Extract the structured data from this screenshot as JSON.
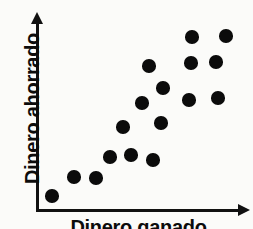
{
  "figure": {
    "title": "",
    "axis_color": "#111111",
    "point_color": "#0b0b0b",
    "background": "#fbfbf9"
  },
  "axes": {
    "y_label": "Dinero ahorrado",
    "x_label": "Dinero ganado",
    "y_arrow_icon": "arrow-up-icon",
    "x_arrow_icon": "arrow-right-icon"
  },
  "chart_data": {
    "type": "scatter",
    "title": "",
    "xlabel": "Dinero ganado",
    "ylabel": "Dinero ahorrado",
    "xlim": [
      0,
      10
    ],
    "ylim": [
      0,
      10
    ],
    "grid": false,
    "legend": "none",
    "point_count": 17,
    "point_radius_px": 6.8,
    "annotation": "Asociacion positiva entre dinero ganado y dinero ahorrado",
    "points": [
      {
        "x": 0.8,
        "y": 0.7,
        "px": 52,
        "py": 196
      },
      {
        "x": 1.9,
        "y": 1.7,
        "px": 74,
        "py": 177
      },
      {
        "x": 3.0,
        "y": 1.6,
        "px": 96,
        "py": 178
      },
      {
        "x": 3.7,
        "y": 2.7,
        "px": 110,
        "py": 157
      },
      {
        "x": 4.8,
        "y": 2.8,
        "px": 131,
        "py": 155
      },
      {
        "x": 5.9,
        "y": 2.6,
        "px": 153,
        "py": 160
      },
      {
        "x": 4.4,
        "y": 4.3,
        "px": 123,
        "py": 127
      },
      {
        "x": 5.4,
        "y": 5.6,
        "px": 142,
        "py": 103
      },
      {
        "x": 6.3,
        "y": 4.6,
        "px": 161,
        "py": 123
      },
      {
        "x": 5.7,
        "y": 7.6,
        "px": 149,
        "py": 66
      },
      {
        "x": 6.4,
        "y": 6.4,
        "px": 163,
        "py": 88
      },
      {
        "x": 7.7,
        "y": 5.8,
        "px": 189,
        "py": 100
      },
      {
        "x": 7.8,
        "y": 7.8,
        "px": 191,
        "py": 63
      },
      {
        "x": 7.9,
        "y": 9.1,
        "px": 192,
        "py": 37
      },
      {
        "x": 9.2,
        "y": 5.9,
        "px": 218,
        "py": 98
      },
      {
        "x": 9.1,
        "y": 7.8,
        "px": 216,
        "py": 62
      },
      {
        "x": 9.6,
        "y": 9.2,
        "px": 226,
        "py": 36
      }
    ]
  }
}
